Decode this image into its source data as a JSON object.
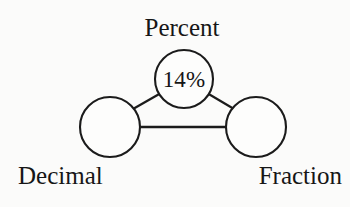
{
  "diagram": {
    "type": "concept-triangle",
    "background_color": "#fbfbfa",
    "stroke_color": "#1b1b1b",
    "text_color": "#161616",
    "nodes": [
      {
        "id": "percent",
        "label": "Percent",
        "value": "14%",
        "label_position": "above",
        "center": {
          "x": 184,
          "y": 79
        },
        "radius": 29
      },
      {
        "id": "decimal",
        "label": "Decimal",
        "value": "",
        "label_position": "below",
        "center": {
          "x": 110,
          "y": 127
        },
        "radius": 30
      },
      {
        "id": "fraction",
        "label": "Fraction",
        "value": "",
        "label_position": "below",
        "center": {
          "x": 256,
          "y": 127
        },
        "radius": 30
      }
    ],
    "edges": [
      {
        "from": "decimal",
        "to": "percent"
      },
      {
        "from": "percent",
        "to": "fraction"
      },
      {
        "from": "decimal",
        "to": "fraction"
      }
    ]
  }
}
